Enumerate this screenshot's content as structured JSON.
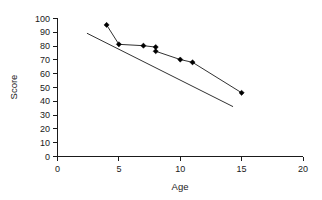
{
  "chart_data": {
    "type": "scatter",
    "title": "",
    "xlabel": "Age",
    "ylabel": "Score",
    "xlim": [
      0,
      20
    ],
    "ylim": [
      0,
      100
    ],
    "xticks": [
      0,
      5,
      10,
      15,
      20
    ],
    "yticks": [
      0,
      10,
      20,
      30,
      40,
      50,
      60,
      70,
      80,
      90,
      100
    ],
    "xtick_labels": [
      "0",
      "5",
      "10",
      "15",
      "20"
    ],
    "ytick_labels": [
      "0",
      "10",
      "20",
      "30",
      "40",
      "50",
      "60",
      "70",
      "80",
      "90",
      "100"
    ],
    "grid": false,
    "legend": "none",
    "marker_style": "filled-diamond",
    "marker_color": "#000000",
    "line_color": "#1a1a1a",
    "series": [
      {
        "name": "Score by Age",
        "connected": true,
        "points": [
          {
            "x": 4,
            "y": 95
          },
          {
            "x": 5,
            "y": 81
          },
          {
            "x": 7,
            "y": 80
          },
          {
            "x": 8,
            "y": 79
          },
          {
            "x": 8,
            "y": 76
          },
          {
            "x": 10,
            "y": 70
          },
          {
            "x": 11,
            "y": 68
          },
          {
            "x": 15,
            "y": 46
          }
        ]
      },
      {
        "name": "Trend line",
        "connected": true,
        "markers": false,
        "points": [
          {
            "x": 2.4,
            "y": 89
          },
          {
            "x": 14.3,
            "y": 36
          }
        ]
      }
    ]
  },
  "axes": {
    "x_title": "Age",
    "y_title": "Score"
  }
}
